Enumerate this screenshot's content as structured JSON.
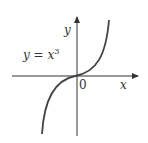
{
  "diagram": {
    "equation_label": "y = x",
    "equation_exponent": "3",
    "x_axis_label": "x",
    "y_axis_label": "y",
    "origin_label": "0",
    "colors": {
      "curve": "#444444",
      "axes": "#333333",
      "text": "#333333"
    }
  }
}
